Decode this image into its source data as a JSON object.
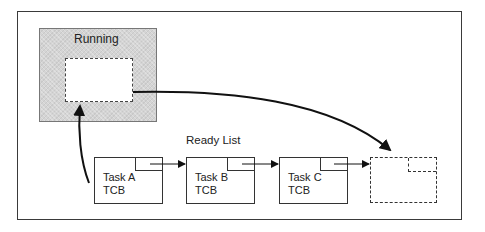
{
  "diagram": {
    "running": {
      "label": "Running"
    },
    "ready_list": {
      "label": "Ready List"
    },
    "tasks": [
      {
        "line1": "Task A",
        "line2": "TCB"
      },
      {
        "line1": "Task B",
        "line2": "TCB"
      },
      {
        "line1": "Task C",
        "line2": "TCB"
      }
    ],
    "empty_slot": {
      "label": ""
    }
  }
}
